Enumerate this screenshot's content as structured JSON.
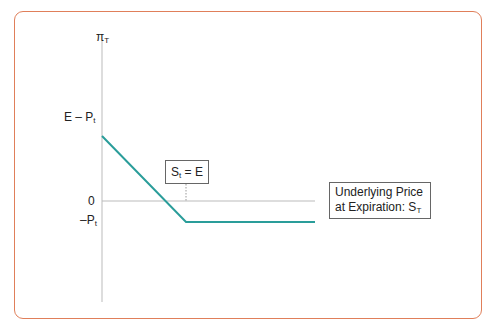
{
  "diagram": {
    "type": "payoff-diagram",
    "y_axis_label": "π",
    "y_axis_label_sub": "T",
    "y_tick_upper": "E – P",
    "y_tick_upper_sub": "t",
    "y_tick_zero": "0",
    "y_tick_lower": "–P",
    "y_tick_lower_sub": "t",
    "strike_label": "S",
    "strike_label_sub": "t",
    "strike_label_rest": " = E",
    "x_axis_label_line1": "Underlying Price",
    "x_axis_label_line2": "at Expiration: S",
    "x_axis_label_sub": "T",
    "colors": {
      "frame": "#e07f5a",
      "payoff_line": "#2a9d9a",
      "axis": "#bbbbbb"
    }
  }
}
